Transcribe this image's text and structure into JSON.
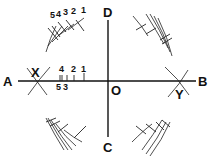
{
  "diagram": {
    "type": "geometric-construction",
    "colors": {
      "ink": "#111111",
      "background": "#ffffff"
    },
    "points": {
      "A": {
        "label": "A"
      },
      "B": {
        "label": "B"
      },
      "C": {
        "label": "C"
      },
      "D": {
        "label": "D"
      },
      "O": {
        "label": "O"
      },
      "X": {
        "label": "X"
      },
      "Y": {
        "label": "Y"
      }
    },
    "top_left_arc_labels": [
      "5",
      "4",
      "3",
      "2",
      "1"
    ],
    "line_ticks": {
      "above": [
        "4",
        "2",
        "1"
      ],
      "below": [
        "5",
        "3"
      ]
    },
    "lines": [
      {
        "name": "AB",
        "orientation": "horizontal"
      },
      {
        "name": "DC",
        "orientation": "vertical"
      }
    ]
  }
}
